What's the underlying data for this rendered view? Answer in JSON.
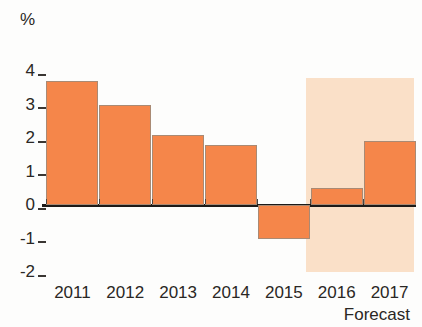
{
  "chart_data": {
    "type": "bar",
    "title": "",
    "subtitle": "",
    "xlabel": "",
    "ylabel": "%",
    "unit_label": "%",
    "categories": [
      "2011",
      "2012",
      "2013",
      "2014",
      "2015",
      "2016",
      "2017"
    ],
    "values": [
      3.7,
      3.0,
      2.1,
      1.8,
      -1.0,
      0.5,
      1.9
    ],
    "series": [
      {
        "name": "",
        "values": [
          3.7,
          3.0,
          2.1,
          1.8,
          -1.0,
          0.5,
          1.9
        ]
      }
    ],
    "ylim": [
      -2,
      4
    ],
    "yticks": [
      4,
      3,
      2,
      1,
      0,
      -1,
      -2
    ],
    "ytick_labels": [
      "4",
      "3",
      "2",
      "1",
      "0",
      "-1",
      "-2"
    ],
    "grid": false,
    "legend": null,
    "legend_position": "none",
    "annotations": [
      {
        "text": "Forecast",
        "applies_to": [
          "2016",
          "2017"
        ]
      }
    ],
    "forecast_caption": "Forecast",
    "forecast_categories": [
      "2016",
      "2017"
    ],
    "colors": {
      "bar": "#F5864A",
      "bar_border": "#A98A74",
      "forecast_band": "#FAE0C8",
      "axis": "#1C1A18",
      "text": "#2A2724",
      "background": "#FDFDFC"
    }
  }
}
